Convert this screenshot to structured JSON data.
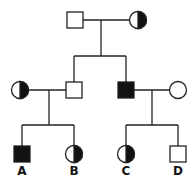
{
  "diagram": {
    "type": "pedigree",
    "stroke_color": "#222222",
    "fill_affected": "#111111",
    "generation1": {
      "father": {
        "sex": "male",
        "status": "unaffected"
      },
      "mother": {
        "sex": "female",
        "status": "carrier"
      }
    },
    "generation2": {
      "left_spouse": {
        "sex": "female",
        "status": "carrier"
      },
      "son": {
        "sex": "male",
        "status": "unaffected"
      },
      "affected_son": {
        "sex": "male",
        "status": "affected"
      },
      "right_spouse": {
        "sex": "female",
        "status": "unaffected"
      }
    },
    "generation3": [
      {
        "label": "A",
        "sex": "male",
        "status": "affected"
      },
      {
        "label": "B",
        "sex": "female",
        "status": "carrier"
      },
      {
        "label": "C",
        "sex": "female",
        "status": "carrier"
      },
      {
        "label": "D",
        "sex": "male",
        "status": "unaffected"
      }
    ]
  }
}
